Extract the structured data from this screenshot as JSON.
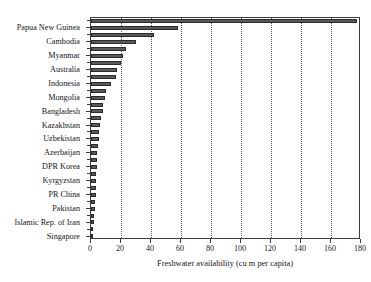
{
  "chart_data": {
    "type": "bar",
    "orientation": "horizontal",
    "title": "",
    "xlabel": "Freshwater availability (cu m per capita)",
    "ylabel": "",
    "xlim": [
      0,
      180
    ],
    "ylim": [
      0,
      32
    ],
    "grid": "vertical dotted gridlines at each labeled x tick",
    "legend": "none",
    "xticks": [
      0,
      20,
      40,
      60,
      80,
      100,
      120,
      140,
      160,
      180
    ],
    "xtick_labels": [
      "0",
      "20",
      "40",
      "60",
      "80",
      "100",
      "120",
      "140",
      "160",
      "180"
    ],
    "categories": [
      "Singapore",
      "Islamic Rep. of Iran",
      "Pakistan",
      "PR China",
      "Kyrgyzstan",
      "DPR Korea",
      "Azerbaijan",
      "Uzbekistan",
      "Kazakhstan",
      "Bangladesh",
      "Mongolia",
      "Indonesia",
      "Australia",
      "Myanmar",
      "Cambodia",
      "Papua New Guinea"
    ],
    "bars": [
      {
        "label": "Singapore",
        "value": 0.2,
        "labeled": true
      },
      {
        "label": "",
        "value": 1.1,
        "labeled": false
      },
      {
        "label": "Islamic Rep. of Iran",
        "value": 1.8,
        "labeled": true
      },
      {
        "label": "",
        "value": 2.2,
        "labeled": false
      },
      {
        "label": "Pakistan",
        "value": 2.5,
        "labeled": true
      },
      {
        "label": "",
        "value": 2.8,
        "labeled": false
      },
      {
        "label": "PR China",
        "value": 3.0,
        "labeled": true
      },
      {
        "label": "",
        "value": 3.2,
        "labeled": false
      },
      {
        "label": "Kyrgyzstan",
        "value": 3.5,
        "labeled": true
      },
      {
        "label": "",
        "value": 3.6,
        "labeled": false
      },
      {
        "label": "DPR Korea",
        "value": 3.8,
        "labeled": true
      },
      {
        "label": "",
        "value": 4.0,
        "labeled": false
      },
      {
        "label": "Azerbaijan",
        "value": 4.2,
        "labeled": true
      },
      {
        "label": "",
        "value": 4.6,
        "labeled": false
      },
      {
        "label": "Uzbekistan",
        "value": 5.2,
        "labeled": true
      },
      {
        "label": "",
        "value": 5.5,
        "labeled": false
      },
      {
        "label": "Kazakhstan",
        "value": 6.3,
        "labeled": true
      },
      {
        "label": "",
        "value": 6.6,
        "labeled": false
      },
      {
        "label": "Bangladesh",
        "value": 7.7,
        "labeled": true
      },
      {
        "label": "",
        "value": 8.0,
        "labeled": false
      },
      {
        "label": "Mongolia",
        "value": 9.5,
        "labeled": true
      },
      {
        "label": "",
        "value": 10.0,
        "labeled": false
      },
      {
        "label": "Indonesia",
        "value": 13.0,
        "labeled": true
      },
      {
        "label": "",
        "value": 16.5,
        "labeled": false
      },
      {
        "label": "Australia",
        "value": 17.0,
        "labeled": true
      },
      {
        "label": "",
        "value": 19.8,
        "labeled": false
      },
      {
        "label": "Myanmar",
        "value": 21.0,
        "labeled": true
      },
      {
        "label": "",
        "value": 23.5,
        "labeled": false
      },
      {
        "label": "Cambodia",
        "value": 30.0,
        "labeled": true
      },
      {
        "label": "",
        "value": 42.0,
        "labeled": false
      },
      {
        "label": "Papua New Guinea",
        "value": 58.0,
        "labeled": true
      },
      {
        "label": "",
        "value": 177.5,
        "labeled": false
      }
    ],
    "bar_color": "#595959",
    "bar_edge_color": "#2b2b2b",
    "axis_color": "#3c3c3c",
    "grid_color": "#5a5a5a",
    "text_color": "#161616"
  }
}
